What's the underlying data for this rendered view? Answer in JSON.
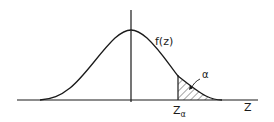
{
  "diagram": {
    "type": "normal-distribution-upper-tail",
    "curve_label": "f(z)",
    "x_axis_label": "Z",
    "critical_value_label": "Z",
    "critical_value_subscript": "α",
    "tail_area_label": "α",
    "colors": {
      "ink": "#1a1a1a",
      "background": "#ffffff"
    }
  }
}
